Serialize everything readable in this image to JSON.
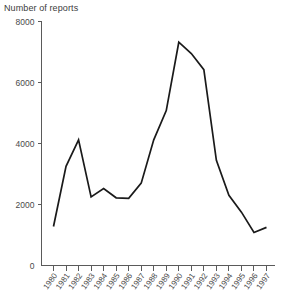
{
  "chart_data": {
    "type": "line",
    "title": "Number of reports",
    "xlabel": "",
    "ylabel": "Number of reports",
    "ylim": [
      0,
      8000
    ],
    "yticks": [
      0,
      2000,
      4000,
      6000,
      8000
    ],
    "ytick_labels": [
      "0",
      "2000",
      "4000",
      "6000",
      "8000"
    ],
    "grid": false,
    "legend": "none",
    "categories": [
      "1980",
      "1981",
      "1982",
      "1983",
      "1984",
      "1985",
      "1986",
      "1987",
      "1988",
      "1989",
      "1990",
      "1991",
      "1992",
      "1993",
      "1994",
      "1995",
      "1996",
      "1997"
    ],
    "values": [
      1280,
      3250,
      4120,
      2250,
      2520,
      2220,
      2200,
      2700,
      4120,
      5080,
      7320,
      6950,
      6420,
      3450,
      2300,
      1750,
      1080,
      1250
    ],
    "series": [
      {
        "name": "Number of reports",
        "values": [
          1280,
          3250,
          4120,
          2250,
          2520,
          2220,
          2200,
          2700,
          4120,
          5080,
          7320,
          6950,
          6420,
          3450,
          2300,
          1750,
          1080,
          1250
        ],
        "color": "#1a1a1a"
      }
    ]
  },
  "axis": {
    "y_axis_title": "Number of reports",
    "axis_color": "#5a5a5a",
    "text_color": "#4a4a4a"
  }
}
